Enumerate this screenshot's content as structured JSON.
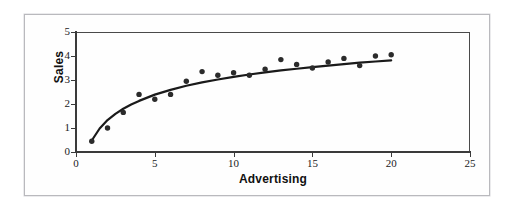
{
  "chart_data": {
    "type": "scatter",
    "title": "",
    "subtitle": "",
    "xlabel": "Advertising",
    "ylabel": "Sales",
    "xlim": [
      0,
      25
    ],
    "ylim": [
      0,
      5
    ],
    "xticks": [
      0,
      5,
      10,
      15,
      20,
      25
    ],
    "yticks": [
      0,
      1,
      2,
      3,
      4,
      5
    ],
    "grid": false,
    "legend": null,
    "legend_position": "none",
    "marker_color": "#2b2b2b",
    "trendline_color": "#1a1a1a",
    "axis_color": "#3a3a3a",
    "frame_color": "#b9b9bd",
    "background_color": "#ffffff",
    "x": [
      1,
      2,
      3,
      4,
      5,
      6,
      7,
      8,
      9,
      10,
      11,
      12,
      13,
      14,
      15,
      16,
      17,
      18,
      19,
      20
    ],
    "y": [
      0.45,
      1.0,
      1.65,
      2.4,
      2.2,
      2.4,
      2.95,
      3.35,
      3.2,
      3.3,
      3.2,
      3.45,
      3.85,
      3.65,
      3.5,
      3.75,
      3.9,
      3.6,
      4.0,
      4.05
    ],
    "series": [
      {
        "name": "Sales vs Advertising",
        "type": "scatter",
        "x": [
          1,
          2,
          3,
          4,
          5,
          6,
          7,
          8,
          9,
          10,
          11,
          12,
          13,
          14,
          15,
          16,
          17,
          18,
          19,
          20
        ],
        "values": [
          0.45,
          1.0,
          1.65,
          2.4,
          2.2,
          2.4,
          2.95,
          3.35,
          3.2,
          3.3,
          3.2,
          3.45,
          3.85,
          3.65,
          3.5,
          3.75,
          3.9,
          3.6,
          4.0,
          4.05
        ]
      },
      {
        "name": "Fitted logarithmic trend",
        "type": "line",
        "x": [
          1,
          1.5,
          2,
          2.5,
          3,
          3.5,
          4,
          5,
          6,
          7,
          8,
          9,
          10,
          11,
          12,
          13,
          14,
          15,
          16,
          17,
          18,
          19,
          20
        ],
        "values": [
          0.48,
          0.98,
          1.33,
          1.59,
          1.8,
          1.98,
          2.13,
          2.39,
          2.59,
          2.76,
          2.9,
          3.02,
          3.13,
          3.23,
          3.32,
          3.4,
          3.47,
          3.54,
          3.6,
          3.66,
          3.72,
          3.77,
          3.82
        ]
      }
    ]
  },
  "axes": {
    "x_title": "Advertising",
    "y_title": "Sales",
    "x_tick_labels": [
      "0",
      "5",
      "10",
      "15",
      "20",
      "25"
    ],
    "y_tick_labels": [
      "0",
      "1",
      "2",
      "3",
      "4",
      "5"
    ]
  }
}
